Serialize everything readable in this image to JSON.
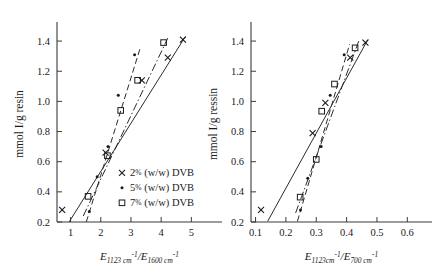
{
  "figure": {
    "background": "#ffffff",
    "ink_color": "#1a1a1a"
  },
  "legend": {
    "position": "inside-left-panel-lower-right",
    "entries": [
      {
        "marker": "cross",
        "label": "2% (w/w) DVB",
        "percent": "2",
        "pct_sign": "%",
        "rest": "(w/w) DVB"
      },
      {
        "marker": "dot",
        "label": "5% (w/w) DVB",
        "percent": "5",
        "pct_sign": "%",
        "rest": "(w/w) DVB"
      },
      {
        "marker": "square",
        "label": "7% (w/w) DVB",
        "percent": "7",
        "pct_sign": "%",
        "rest": "(w/w) DVB"
      }
    ]
  },
  "chart_data": [
    {
      "id": "left-panel",
      "type": "scatter",
      "title": "",
      "xlabel": "E_1123 cm^-1 / E_1600 cm^-1",
      "xlabel_parts": {
        "E1": "E",
        "sub1": "1123 cm",
        "sup1": "-1",
        "slash": "/",
        "E2": "E",
        "sub2": "1600 cm",
        "sup2": "-1"
      },
      "ylabel": "mmol I/g resin",
      "xlim": [
        0.55,
        5.75
      ],
      "ylim": [
        0.2,
        1.5
      ],
      "xticks": [
        1,
        2,
        3,
        4,
        5
      ],
      "xticklabels": [
        "1",
        "2",
        "3",
        "4",
        "5"
      ],
      "yticks": [
        0.2,
        0.4,
        0.6,
        0.8,
        1.0,
        1.2,
        1.4
      ],
      "yticklabels": [
        "0.2",
        "0.4",
        "0.6",
        "0.8",
        "1.0",
        "1.2",
        "1.4"
      ],
      "grid": false,
      "series": [
        {
          "name": "2% (w/w) DVB",
          "marker": "cross",
          "linestyle": "solid",
          "points": [
            {
              "x": 0.72,
              "y": 0.28
            },
            {
              "x": 2.16,
              "y": 0.66
            },
            {
              "x": 3.36,
              "y": 1.14
            },
            {
              "x": 4.22,
              "y": 1.29
            },
            {
              "x": 4.72,
              "y": 1.41
            }
          ],
          "fit": {
            "x1": 0.95,
            "y1": 0.2,
            "x2": 4.8,
            "y2": 1.43
          }
        },
        {
          "name": "5% (w/w) DVB",
          "marker": "dot",
          "linestyle": "dashed",
          "points": [
            {
              "x": 1.62,
              "y": 0.27
            },
            {
              "x": 1.88,
              "y": 0.5
            },
            {
              "x": 2.24,
              "y": 0.7
            },
            {
              "x": 2.58,
              "y": 1.04
            },
            {
              "x": 3.12,
              "y": 1.31
            }
          ],
          "fit": {
            "x1": 1.52,
            "y1": 0.2,
            "x2": 3.3,
            "y2": 1.35
          }
        },
        {
          "name": "7% (w/w) DVB",
          "marker": "square",
          "linestyle": "dashdot",
          "points": [
            {
              "x": 1.58,
              "y": 0.37
            },
            {
              "x": 2.22,
              "y": 0.64
            },
            {
              "x": 2.66,
              "y": 0.94
            },
            {
              "x": 3.22,
              "y": 1.14
            },
            {
              "x": 4.08,
              "y": 1.39
            }
          ],
          "fit": {
            "x1": 1.42,
            "y1": 0.24,
            "x2": 4.22,
            "y2": 1.42
          }
        }
      ]
    },
    {
      "id": "right-panel",
      "type": "scatter",
      "title": "",
      "xlabel": "E_1123 cm^-1 / E_700 cm^-1",
      "xlabel_parts": {
        "E1": "E",
        "sub1": "1123cm",
        "sup1": "-1",
        "slash": "/",
        "E2": "E",
        "sub2": "700 cm",
        "sup2": "-1"
      },
      "ylabel": "mmol I/g ressin",
      "xlim": [
        0.085,
        0.655
      ],
      "ylim": [
        0.2,
        1.5
      ],
      "xticks": [
        0.1,
        0.2,
        0.3,
        0.4,
        0.5,
        0.6
      ],
      "xticklabels": [
        "0.1",
        "0.2",
        "0.3",
        "0.4",
        "0.5",
        "0.6"
      ],
      "yticks": [
        0.2,
        0.4,
        0.6,
        0.8,
        1.0,
        1.2,
        1.4
      ],
      "yticklabels": [
        "0.2",
        "0.4",
        "0.6",
        "0.8",
        "1.0",
        "1.2",
        "1.4"
      ],
      "grid": false,
      "series": [
        {
          "name": "2% (w/w) DVB",
          "marker": "cross",
          "linestyle": "solid",
          "points": [
            {
              "x": 0.118,
              "y": 0.28
            },
            {
              "x": 0.288,
              "y": 0.79
            },
            {
              "x": 0.33,
              "y": 0.99
            },
            {
              "x": 0.412,
              "y": 1.29
            },
            {
              "x": 0.462,
              "y": 1.39
            }
          ],
          "fit": {
            "x1": 0.14,
            "y1": 0.205,
            "x2": 0.47,
            "y2": 1.41
          }
        },
        {
          "name": "5% (w/w) DVB",
          "marker": "dot",
          "linestyle": "dashed",
          "points": [
            {
              "x": 0.248,
              "y": 0.28
            },
            {
              "x": 0.272,
              "y": 0.49
            },
            {
              "x": 0.316,
              "y": 0.7
            },
            {
              "x": 0.346,
              "y": 1.04
            },
            {
              "x": 0.392,
              "y": 1.31
            }
          ],
          "fit": {
            "x1": 0.238,
            "y1": 0.205,
            "x2": 0.41,
            "y2": 1.38
          }
        },
        {
          "name": "7% (w/w) DVB",
          "marker": "square",
          "linestyle": "dashdot",
          "points": [
            {
              "x": 0.247,
              "y": 0.365
            },
            {
              "x": 0.3,
              "y": 0.615
            },
            {
              "x": 0.318,
              "y": 0.935
            },
            {
              "x": 0.36,
              "y": 1.115
            },
            {
              "x": 0.428,
              "y": 1.355
            }
          ],
          "fit": {
            "x1": 0.232,
            "y1": 0.26,
            "x2": 0.44,
            "y2": 1.4
          }
        }
      ]
    }
  ]
}
